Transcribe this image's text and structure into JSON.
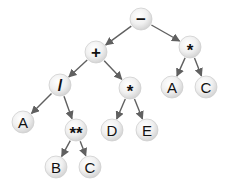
{
  "diagram": {
    "type": "expression-tree",
    "colors": {
      "background": "#ffffff",
      "node_fill_light": "#fafafa",
      "node_fill_dark": "#d4d4d4",
      "node_stroke": "#cfcfcf",
      "edge": "#606060",
      "text": "#111111"
    },
    "node_radius": 11,
    "nodes": [
      {
        "id": "n0",
        "label": "−",
        "x": 141,
        "y": 19,
        "kind": "operator"
      },
      {
        "id": "n1",
        "label": "+",
        "x": 96,
        "y": 52,
        "kind": "operator"
      },
      {
        "id": "n2",
        "label": "*",
        "x": 190,
        "y": 47,
        "kind": "operator"
      },
      {
        "id": "n3",
        "label": "/",
        "x": 60,
        "y": 85,
        "kind": "operator"
      },
      {
        "id": "n4",
        "label": "*",
        "x": 130,
        "y": 88,
        "kind": "operator"
      },
      {
        "id": "n5",
        "label": "A",
        "x": 172,
        "y": 87,
        "kind": "operand"
      },
      {
        "id": "n6",
        "label": "C",
        "x": 206,
        "y": 87,
        "kind": "operand"
      },
      {
        "id": "n7",
        "label": "A",
        "x": 23,
        "y": 122,
        "kind": "operand"
      },
      {
        "id": "n8",
        "label": "**",
        "x": 76,
        "y": 130,
        "kind": "operator"
      },
      {
        "id": "n9",
        "label": "D",
        "x": 112,
        "y": 130,
        "kind": "operand"
      },
      {
        "id": "n10",
        "label": "E",
        "x": 147,
        "y": 130,
        "kind": "operand"
      },
      {
        "id": "n11",
        "label": "B",
        "x": 56,
        "y": 167,
        "kind": "operand"
      },
      {
        "id": "n12",
        "label": "C",
        "x": 90,
        "y": 167,
        "kind": "operand"
      }
    ],
    "edges": [
      {
        "from": "n0",
        "to": "n1"
      },
      {
        "from": "n0",
        "to": "n2"
      },
      {
        "from": "n1",
        "to": "n3"
      },
      {
        "from": "n1",
        "to": "n4"
      },
      {
        "from": "n2",
        "to": "n5"
      },
      {
        "from": "n2",
        "to": "n6"
      },
      {
        "from": "n3",
        "to": "n7"
      },
      {
        "from": "n3",
        "to": "n8"
      },
      {
        "from": "n4",
        "to": "n9"
      },
      {
        "from": "n4",
        "to": "n10"
      },
      {
        "from": "n8",
        "to": "n11"
      },
      {
        "from": "n8",
        "to": "n12"
      }
    ]
  }
}
